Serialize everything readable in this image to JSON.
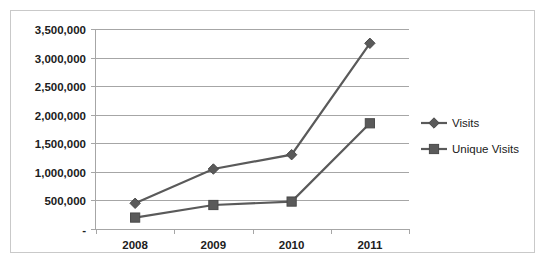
{
  "chart_data": {
    "type": "line",
    "title": "",
    "xlabel": "",
    "ylabel": "",
    "categories": [
      "2008",
      "2009",
      "2010",
      "2011"
    ],
    "series": [
      {
        "name": "Visits",
        "marker": "diamond",
        "color": "#5a5a5a",
        "values": [
          450000,
          1050000,
          1300000,
          3250000
        ]
      },
      {
        "name": "Unique Visits",
        "marker": "square",
        "color": "#5a5a5a",
        "values": [
          200000,
          420000,
          480000,
          1850000
        ]
      }
    ],
    "ylim": [
      0,
      3500000
    ],
    "y_ticks": [
      0,
      500000,
      1000000,
      1500000,
      2000000,
      2500000,
      3000000,
      3500000
    ],
    "y_tick_labels": [
      "-",
      "500,000",
      "1,000,000",
      "1,500,000",
      "2,000,000",
      "2,500,000",
      "3,000,000",
      "3,500,000"
    ],
    "grid": true,
    "legend_position": "right",
    "border_color": "#c9c9c9",
    "gridline_color": "#a6a6a6"
  },
  "legend": {
    "entries": [
      {
        "label": "Visits",
        "marker": "diamond-marker"
      },
      {
        "label": "Unique Visits",
        "marker": "square-marker"
      }
    ]
  },
  "axis": {
    "y_labels": [
      "3,500,000",
      "3,000,000",
      "2,500,000",
      "2,000,000",
      "1,500,000",
      "1,000,000",
      "500,000",
      "-"
    ],
    "x_labels": [
      "2008",
      "2009",
      "2010",
      "2011"
    ]
  }
}
